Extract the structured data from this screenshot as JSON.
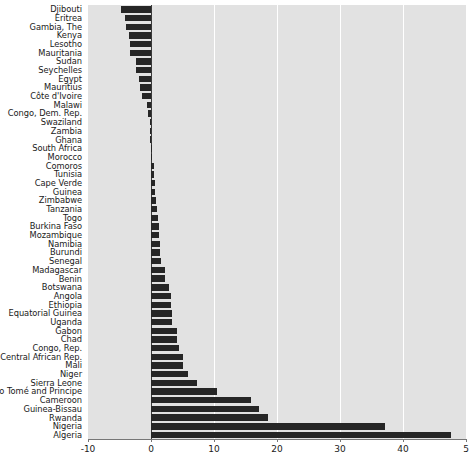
{
  "chart_data": {
    "type": "bar",
    "orientation": "horizontal",
    "title": "",
    "subtitle": "",
    "xlabel": "",
    "ylabel": "",
    "xlim": [
      -10,
      50
    ],
    "ylim": null,
    "grid": true,
    "gridlines_x": [
      0,
      10,
      20,
      30,
      40
    ],
    "legend": null,
    "legend_position": "none",
    "xticks": [
      -10,
      0,
      10,
      20,
      30,
      40,
      50
    ],
    "xtick_labels": [
      "-10",
      "0",
      "10",
      "20",
      "30",
      "40",
      "5"
    ],
    "colors": {
      "bar": "#262626",
      "plot_background": "#e2e2e2",
      "page_background": "#ffffff",
      "gridline": "#ffffff",
      "zero_line": "#3a3a3a",
      "text": "#1a1a1a"
    },
    "categories": [
      "Djibouti",
      "Eritrea",
      "Gambia, The",
      "Kenya",
      "Lesotho",
      "Mauritania",
      "Sudan",
      "Seychelles",
      "Egypt",
      "Mauritius",
      "Côte d'Ivoire",
      "Malawi",
      "Congo, Dem. Rep.",
      "Swaziland",
      "Zambia",
      "Ghana",
      "South Africa",
      "Morocco",
      "Comoros",
      "Tunisia",
      "Cape Verde",
      "Guinea",
      "Zimbabwe",
      "Tanzania",
      "Togo",
      "Burkina Faso",
      "Mozambique",
      "Namibia",
      "Burundi",
      "Senegal",
      "Madagascar",
      "Benin",
      "Botswana",
      "Angola",
      "Ethiopia",
      "Equatorial Guinea",
      "Uganda",
      "Gabon",
      "Chad",
      "Congo, Rep.",
      "Central African Rep.",
      "Mali",
      "Niger",
      "Sierra Leone",
      "São Tomé and Principe",
      "Cameroon",
      "Guinea-Bissau",
      "Rwanda",
      "Nigeria",
      "Algeria"
    ],
    "values": [
      -4.7,
      -4.2,
      -4.0,
      -3.5,
      -3.3,
      -3.3,
      -2.4,
      -2.4,
      -1.9,
      -1.8,
      -1.5,
      -0.6,
      -0.4,
      -0.1,
      -0.1,
      -0.1,
      0.0,
      0.0,
      0.4,
      0.5,
      0.6,
      0.7,
      0.8,
      0.9,
      1.1,
      1.2,
      1.3,
      1.4,
      1.5,
      1.6,
      2.2,
      2.3,
      2.9,
      3.1,
      3.2,
      3.3,
      3.4,
      4.1,
      4.2,
      4.4,
      5.0,
      5.1,
      5.8,
      7.3,
      10.4,
      15.9,
      17.2,
      18.6,
      37.2,
      47.6
    ]
  }
}
